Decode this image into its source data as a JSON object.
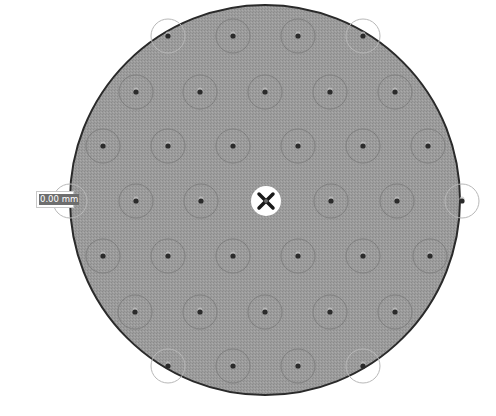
{
  "viewport": {
    "width": 496,
    "height": 416
  },
  "disc": {
    "center": [
      265,
      200
    ],
    "radius": 195,
    "fill": "#9a9a9a",
    "stroke": "#2a2a2a"
  },
  "hole_pattern": {
    "ring_radius": 17,
    "dot_radius": 2.6,
    "ring_color": "#7f7f7f",
    "edge_ring_color": "#b8b8b8",
    "dot_color": "#2b2b2b",
    "rows": [
      {
        "y": 36,
        "x": [
          168,
          233,
          298,
          363
        ],
        "edge": [
          true,
          false,
          false,
          true
        ]
      },
      {
        "y": 92,
        "x": [
          136,
          200,
          265,
          330,
          395
        ],
        "edge": [
          false,
          false,
          false,
          false,
          false
        ]
      },
      {
        "y": 146,
        "x": [
          103,
          168,
          233,
          298,
          363,
          428
        ],
        "edge": [
          false,
          false,
          false,
          false,
          false,
          false
        ]
      },
      {
        "y": 201,
        "x": [
          70,
          136,
          201,
          331,
          397,
          462
        ],
        "edge": [
          true,
          false,
          false,
          false,
          false,
          true
        ]
      },
      {
        "y": 256,
        "x": [
          103,
          168,
          233,
          298,
          363,
          430
        ],
        "edge": [
          false,
          false,
          false,
          false,
          false,
          false
        ]
      },
      {
        "y": 312,
        "x": [
          135,
          200,
          265,
          330,
          395
        ],
        "edge": [
          false,
          false,
          false,
          false,
          false
        ]
      },
      {
        "y": 366,
        "x": [
          168,
          233,
          298,
          363
        ],
        "edge": [
          true,
          false,
          false,
          true
        ]
      }
    ]
  },
  "center_marker": {
    "x": 266,
    "y": 201,
    "radius": 15,
    "icon": "move-cross-icon",
    "fill": "#ffffff",
    "cross_color": "#1a1a1a"
  },
  "dimension_input": {
    "value": "0.00 mm"
  }
}
